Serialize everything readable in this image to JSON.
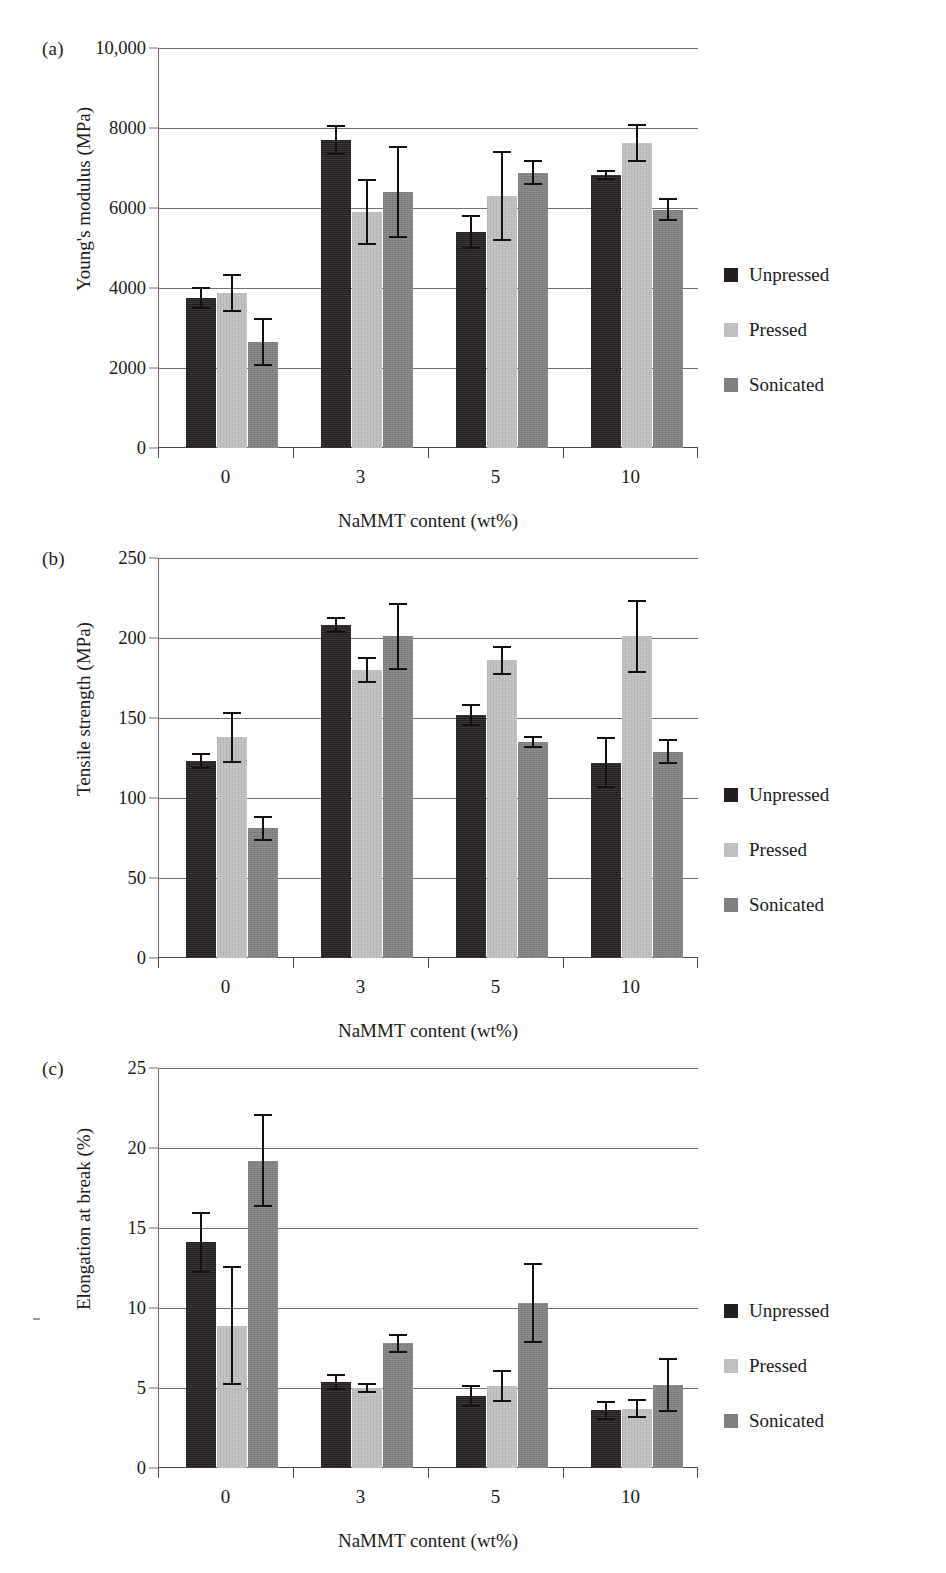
{
  "figure": {
    "panels": [
      {
        "label": "(a)",
        "xlabel": "NaMMT content (wt%)",
        "ylabel": "Young's modulus (MPa)",
        "yticks": [
          "0",
          "2000",
          "4000",
          "6000",
          "8000",
          "10,000"
        ]
      },
      {
        "label": "(b)",
        "xlabel": "NaMMT content (wt%)",
        "ylabel": "Tensile strength (MPa)",
        "yticks": [
          "0",
          "50",
          "100",
          "150",
          "200",
          "250"
        ]
      },
      {
        "label": "(c)",
        "xlabel": "NaMMT content (wt%)",
        "ylabel": "Elongation at break (%)",
        "yticks": [
          "0",
          "5",
          "10",
          "15",
          "20",
          "25"
        ]
      }
    ],
    "legend": [
      {
        "label": "Unpressed",
        "color": "#231f20"
      },
      {
        "label": "Pressed",
        "color": "#bfbfbf"
      },
      {
        "label": "Sonicated",
        "color": "#808080"
      }
    ]
  },
  "chart_data": [
    {
      "type": "bar",
      "panel": "(a)",
      "title": "",
      "xlabel": "NaMMT content (wt%)",
      "ylabel": "Young's modulus (MPa)",
      "categories": [
        "0",
        "3",
        "5",
        "10"
      ],
      "ylim": [
        0,
        10000
      ],
      "yticks": [
        0,
        2000,
        4000,
        6000,
        8000,
        10000
      ],
      "ytick_labels": [
        "0",
        "2000",
        "4000",
        "6000",
        "8000",
        "10,000"
      ],
      "grid": true,
      "legend_position": "right",
      "series": [
        {
          "name": "Unpressed",
          "color": "#231f20",
          "values": [
            3750,
            7700,
            5400,
            6830
          ],
          "errors": [
            270,
            380,
            420,
            130
          ]
        },
        {
          "name": "Pressed",
          "color": "#bfbfbf",
          "values": [
            3870,
            5900,
            6300,
            7630
          ],
          "errors": [
            480,
            820,
            1130,
            470
          ]
        },
        {
          "name": "Sonicated",
          "color": "#808080",
          "values": [
            2650,
            6400,
            6880,
            5960
          ],
          "errors": [
            600,
            1150,
            310,
            290
          ]
        }
      ]
    },
    {
      "type": "bar",
      "panel": "(b)",
      "title": "",
      "xlabel": "NaMMT content (wt%)",
      "ylabel": "Tensile strength (MPa)",
      "categories": [
        "0",
        "3",
        "5",
        "10"
      ],
      "ylim": [
        0,
        250
      ],
      "yticks": [
        0,
        50,
        100,
        150,
        200,
        250
      ],
      "ytick_labels": [
        "0",
        "50",
        "100",
        "150",
        "200",
        "250"
      ],
      "grid": true,
      "legend_position": "right",
      "series": [
        {
          "name": "Unpressed",
          "color": "#231f20",
          "values": [
            123,
            208,
            152,
            122
          ],
          "errors": [
            5,
            5,
            7,
            16
          ]
        },
        {
          "name": "Pressed",
          "color": "#bfbfbf",
          "values": [
            138,
            180,
            186,
            201
          ],
          "errors": [
            16,
            8,
            9,
            23
          ]
        },
        {
          "name": "Sonicated",
          "color": "#808080",
          "values": [
            81,
            201,
            135,
            129
          ],
          "errors": [
            8,
            21,
            4,
            8
          ]
        }
      ]
    },
    {
      "type": "bar",
      "panel": "(c)",
      "title": "",
      "xlabel": "NaMMT content (wt%)",
      "ylabel": "Elongation at break (%)",
      "categories": [
        "0",
        "3",
        "5",
        "10"
      ],
      "ylim": [
        0,
        25
      ],
      "yticks": [
        0,
        5,
        10,
        15,
        20,
        25
      ],
      "ytick_labels": [
        "0",
        "5",
        "10",
        "15",
        "20",
        "25"
      ],
      "grid": true,
      "legend_position": "right",
      "series": [
        {
          "name": "Unpressed",
          "color": "#231f20",
          "values": [
            14.1,
            5.4,
            4.5,
            3.6
          ],
          "errors": [
            1.9,
            0.5,
            0.7,
            0.6
          ]
        },
        {
          "name": "Pressed",
          "color": "#bfbfbf",
          "values": [
            8.9,
            5.0,
            5.1,
            3.7
          ],
          "errors": [
            3.7,
            0.3,
            1.0,
            0.6
          ]
        },
        {
          "name": "Sonicated",
          "color": "#808080",
          "values": [
            19.2,
            7.8,
            10.3,
            5.2
          ],
          "errors": [
            2.9,
            0.6,
            2.5,
            1.7
          ]
        }
      ]
    }
  ]
}
